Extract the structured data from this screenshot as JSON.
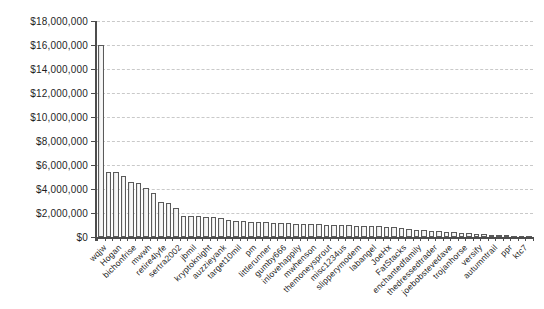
{
  "chart_data": {
    "type": "bar",
    "title": "",
    "xlabel": "",
    "ylabel": "",
    "grid": true,
    "legend": "none",
    "y_axis": {
      "min": 0,
      "max": 18000000,
      "step": 2000000,
      "tick_labels": [
        "$18,000,000",
        "$16,000,000",
        "$14,000,000",
        "$12,000,000",
        "$10,000,000",
        "$8,000,000",
        "$6,000,000",
        "$4,000,000",
        "$2,000,000",
        "$0"
      ]
    },
    "x_labels": [
      "wqjw",
      "Hogan",
      "bichonfrise",
      "mwwh",
      "retire4lyfe",
      "sertra2002",
      "jbmil",
      "kryptoknight",
      "auzzieyank",
      "target10mil",
      "pm",
      "littlerunner",
      "gumby666",
      "inlovehappily",
      "mwhenson",
      "themoneysprout",
      "misc1234us",
      "slipperymodem",
      "labangel",
      "JoeHx",
      "FatStacks",
      "enchantedfamily",
      "thedressedtrader",
      "joebobstevedave",
      "trojanhorse",
      "versify",
      "autumntrail",
      "ppr",
      "ktc7"
    ],
    "x_label_step": 2,
    "values": [
      16000000,
      5450000,
      5400000,
      5050000,
      4600000,
      4500000,
      4050000,
      3700000,
      2950000,
      2800000,
      2450000,
      1780000,
      1750000,
      1720000,
      1700000,
      1650000,
      1550000,
      1450000,
      1350000,
      1300000,
      1270000,
      1240000,
      1220000,
      1200000,
      1170000,
      1140000,
      1120000,
      1100000,
      1080000,
      1050000,
      1030000,
      1000000,
      980000,
      960000,
      940000,
      920000,
      900000,
      880000,
      860000,
      800000,
      740000,
      680000,
      620000,
      560000,
      510000,
      460000,
      420000,
      380000,
      340000,
      300000,
      260000,
      230000,
      200000,
      170000,
      140000,
      110000,
      80000,
      60000
    ],
    "colors": {
      "bar_fill": "#f4f4f4",
      "bar_border": "#5a5a5a",
      "gridline": "#c9c9c9",
      "axis": "#4d4d4d",
      "text": "#1f1f1f"
    }
  }
}
